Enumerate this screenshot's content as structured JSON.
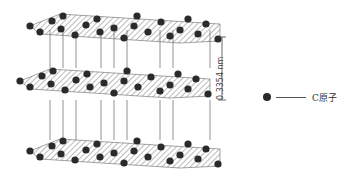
{
  "layer_spacing_label": "0.3354 nm",
  "legend": {
    "items": [
      {
        "symbol": "filled-circle",
        "label": "C原子"
      }
    ]
  },
  "colors": {
    "atom": "#2a2a2a",
    "bond": "#666666",
    "hatch": "#777777",
    "background": "#ffffff"
  },
  "structure": {
    "layers": 3,
    "atom_type": "C",
    "layer_style": "hatched hexagonal sheets",
    "interlayer_bonds": "vertical lines"
  }
}
